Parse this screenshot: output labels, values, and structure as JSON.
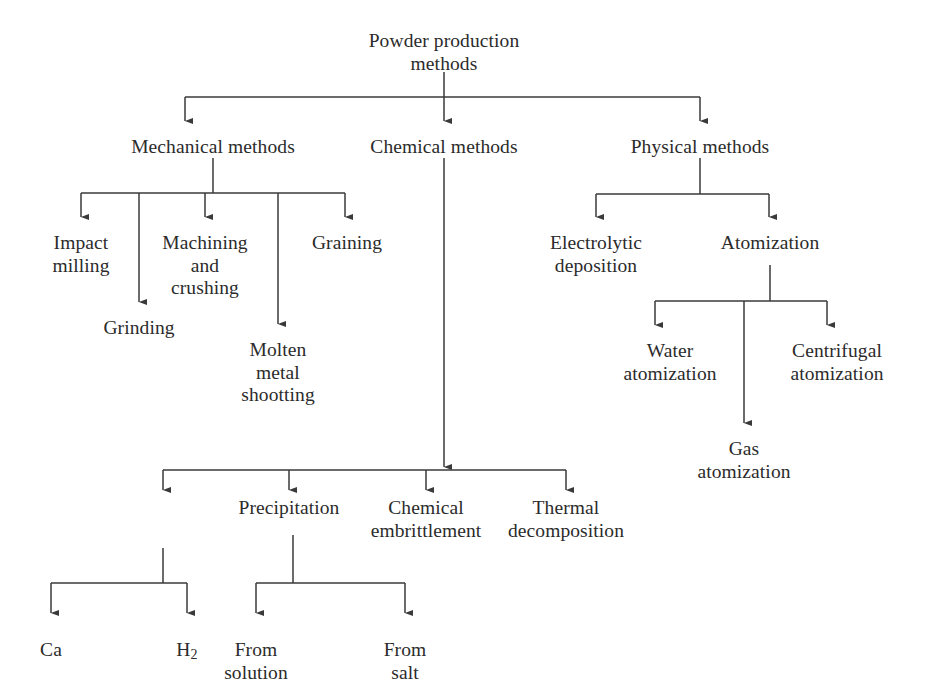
{
  "diagram": {
    "title": "Powder production methods",
    "type": "tree-flowchart",
    "orientation": "top-down",
    "background_color": "#ffffff",
    "line_color": "#3a3a3a",
    "text_color": "#2b2b2b",
    "nodes": {
      "root": {
        "label": "Powder production\nmethods",
        "x": 444,
        "y": 30
      },
      "mechanical": {
        "label": "Mechanical methods",
        "x": 213,
        "y": 136
      },
      "chemical": {
        "label": "Chemical methods",
        "x": 444,
        "y": 136
      },
      "physical": {
        "label": "Physical methods",
        "x": 700,
        "y": 136
      },
      "impact_milling": {
        "label": "Impact\nmilling",
        "x": 81,
        "y": 232
      },
      "grinding": {
        "label": "Grinding",
        "x": 139,
        "y": 317
      },
      "machining_crushing": {
        "label": "Machining\nand\ncrushing",
        "x": 205,
        "y": 232
      },
      "molten_metal": {
        "label": "Molten\nmetal\nshootting",
        "x": 278,
        "y": 339
      },
      "graining": {
        "label": "Graining",
        "x": 347,
        "y": 232
      },
      "electrolytic": {
        "label": "Electrolytic\ndeposition",
        "x": 596,
        "y": 232
      },
      "atomization": {
        "label": "Atomization",
        "x": 770,
        "y": 232
      },
      "water_atomization": {
        "label": "Water\natomization",
        "x": 670,
        "y": 340
      },
      "gas_atomization": {
        "label": "Gas\natomization",
        "x": 744,
        "y": 438
      },
      "centrifugal_atomization": {
        "label": "Centrifugal\natomization",
        "x": 837,
        "y": 340
      },
      "reduction_group": {
        "label": "",
        "x": 163,
        "y": 500
      },
      "precipitation": {
        "label": "Precipitation",
        "x": 289,
        "y": 497
      },
      "chemical_embrittlement": {
        "label": "Chemical\nembrittlement",
        "x": 426,
        "y": 497
      },
      "thermal_decomposition": {
        "label": "Thermal\ndecomposition",
        "x": 566,
        "y": 497
      },
      "ca": {
        "label": "Ca",
        "x": 51,
        "y": 639
      },
      "h2_prefix": {
        "label": "H",
        "sub": "2",
        "x": 187,
        "y": 639
      },
      "from_solution": {
        "label": "From\nsolution",
        "x": 256,
        "y": 639
      },
      "from_salt": {
        "label": "From\nsalt",
        "x": 405,
        "y": 639
      }
    },
    "edges": [
      {
        "from": "root",
        "to": "mechanical"
      },
      {
        "from": "root",
        "to": "chemical"
      },
      {
        "from": "root",
        "to": "physical"
      },
      {
        "from": "mechanical",
        "to": "impact_milling"
      },
      {
        "from": "mechanical",
        "to": "grinding"
      },
      {
        "from": "mechanical",
        "to": "machining_crushing"
      },
      {
        "from": "mechanical",
        "to": "molten_metal"
      },
      {
        "from": "mechanical",
        "to": "graining"
      },
      {
        "from": "physical",
        "to": "electrolytic"
      },
      {
        "from": "physical",
        "to": "atomization"
      },
      {
        "from": "atomization",
        "to": "water_atomization"
      },
      {
        "from": "atomization",
        "to": "gas_atomization"
      },
      {
        "from": "atomization",
        "to": "centrifugal_atomization"
      },
      {
        "from": "chemical",
        "to": "reduction_group"
      },
      {
        "from": "chemical",
        "to": "precipitation"
      },
      {
        "from": "chemical",
        "to": "chemical_embrittlement"
      },
      {
        "from": "chemical",
        "to": "thermal_decomposition"
      },
      {
        "from": "reduction_group",
        "to": "ca"
      },
      {
        "from": "reduction_group",
        "to": "h2_prefix"
      },
      {
        "from": "precipitation",
        "to": "from_solution"
      },
      {
        "from": "precipitation",
        "to": "from_salt"
      }
    ]
  }
}
